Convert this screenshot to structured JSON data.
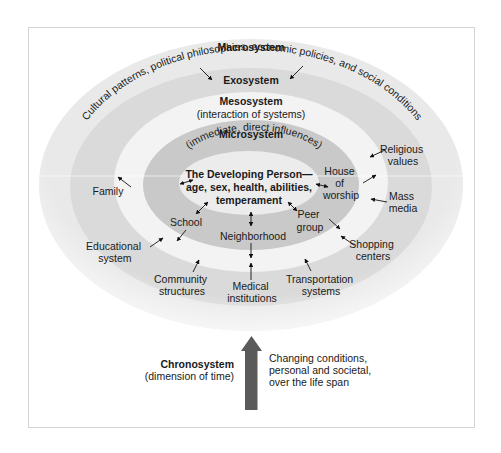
{
  "diagram": {
    "type": "ecological-systems-model",
    "colors": {
      "macro_ring": "#e9e9e9",
      "exo_ring": "#dadada",
      "meso_ring": "#f3f3f3",
      "micro_ring": "#c9c9c9",
      "center": "#ececec",
      "chrono_arrow": "#5a5a5a",
      "frame_border": "#d4d4d4"
    },
    "macrosystem": {
      "title": "Macrosystem",
      "description": "Cultural patterns, political philosophies, economic policies, and social conditions"
    },
    "exosystem": {
      "title": "Exosystem"
    },
    "mesosystem": {
      "title": "Mesosystem",
      "description": "(interaction of systems)"
    },
    "microsystem": {
      "title": "Microsystem",
      "description": "(immediate, direct influences)"
    },
    "center": {
      "line1": "The Developing Person—",
      "line2": "age, sex, health, abilities,",
      "line3": "temperament"
    },
    "micro_items": {
      "family": "Family",
      "school": "School",
      "neighborhood": "Neighborhood",
      "peer_group": [
        "Peer",
        "group"
      ],
      "house_of_worship": [
        "House",
        "of",
        "worship"
      ]
    },
    "exo_items": {
      "religious_values": [
        "Religious",
        "values"
      ],
      "mass_media": [
        "Mass",
        "media"
      ],
      "shopping_centers": [
        "Shopping",
        "centers"
      ],
      "transportation_systems": [
        "Transportation",
        "systems"
      ],
      "medical_institutions": [
        "Medical",
        "institutions"
      ],
      "community_structures": [
        "Community",
        "structures"
      ],
      "educational_system": [
        "Educational",
        "system"
      ]
    },
    "chronosystem": {
      "title": "Chronosystem",
      "subtitle": "(dimension of time)",
      "description": [
        "Changing conditions,",
        "personal and societal,",
        "over the life span"
      ]
    }
  }
}
